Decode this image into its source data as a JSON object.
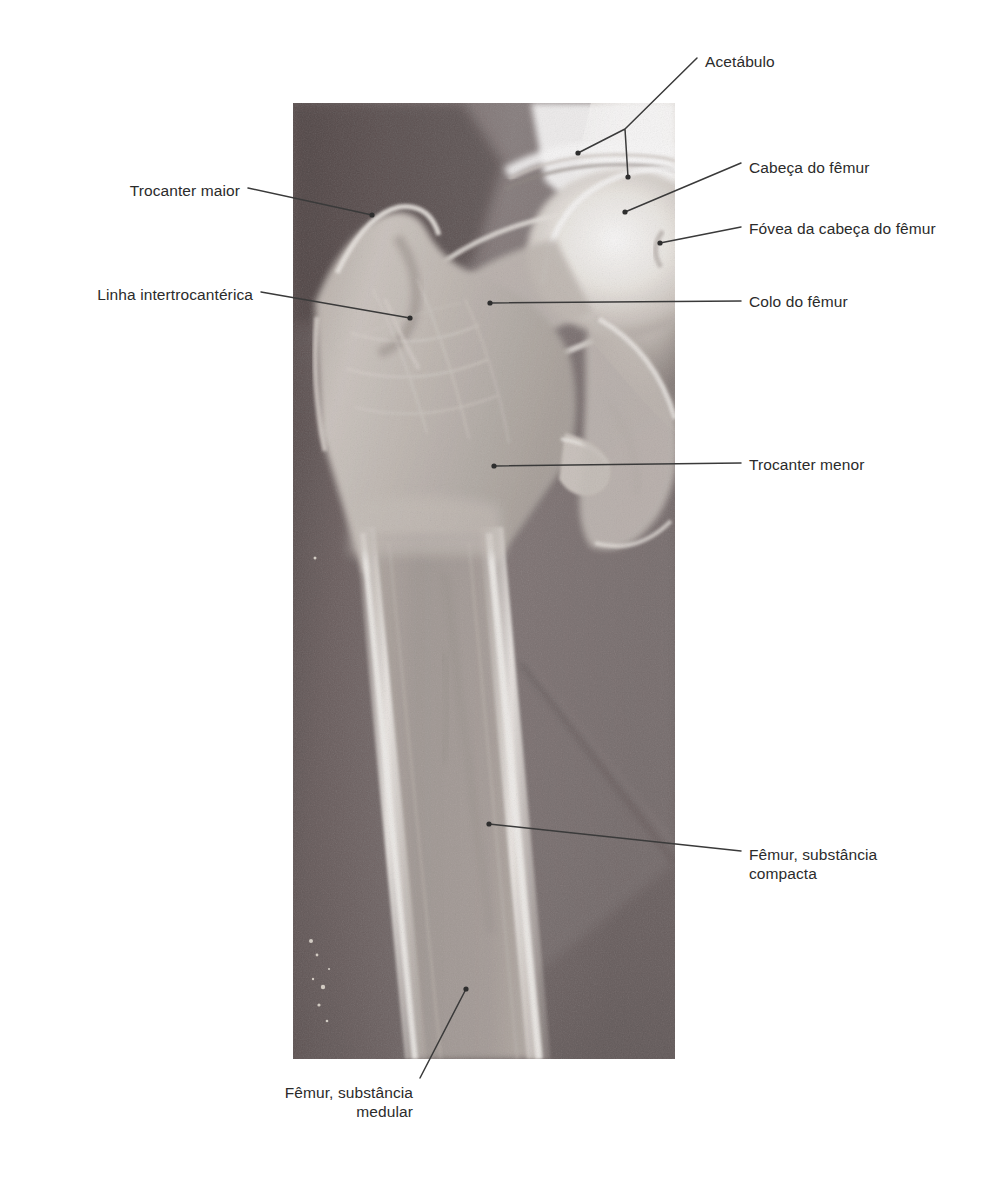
{
  "figure": {
    "image_kind": "x-ray-radiograph",
    "background_color": "#ffffff",
    "text_color": "#2b2b2b",
    "leader_color": "#3a3a3a"
  },
  "xray": {
    "left": 293,
    "top": 103,
    "width": 382,
    "height": 956,
    "soft_tissue_dark": "#605353",
    "soft_tissue_mid": "#7a7070",
    "bone_mid": "#b9b2ac",
    "bone_bright": "#e6e2dc",
    "bone_white": "#f6f4f1"
  },
  "labels": [
    {
      "id": "acetabulo",
      "name": "Acetábulo",
      "lines": [
        "Acetábulo"
      ],
      "align": "left",
      "x": 705,
      "y": 52
    },
    {
      "id": "cabeca-do-femur",
      "name": "Cabeça do fêmur",
      "lines": [
        "Cabeça do fêmur"
      ],
      "align": "left",
      "x": 749,
      "y": 158
    },
    {
      "id": "fovea-da-cabeca-do-femur",
      "name": "Fóvea da cabeça do fêmur",
      "lines": [
        "Fóvea da cabeça do fêmur"
      ],
      "align": "left",
      "x": 749,
      "y": 219
    },
    {
      "id": "colo-do-femur",
      "name": "Colo do fêmur",
      "lines": [
        "Colo do fêmur"
      ],
      "align": "left",
      "x": 749,
      "y": 292
    },
    {
      "id": "trocanter-menor",
      "name": "Trocanter menor",
      "lines": [
        "Trocanter menor"
      ],
      "align": "left",
      "x": 749,
      "y": 455
    },
    {
      "id": "femur-substancia-compacta",
      "name": "Fêmur, substância compacta",
      "lines": [
        "Fêmur, substância",
        "compacta"
      ],
      "align": "left",
      "x": 749,
      "y": 845
    },
    {
      "id": "trocanter-maior",
      "name": "Trocanter maior",
      "lines": [
        "Trocanter maior"
      ],
      "align": "right",
      "x": 117,
      "y": 181,
      "right_edge": 240
    },
    {
      "id": "linha-intertrocanterica",
      "name": "Linha intertrocantérica",
      "lines": [
        "Linha intertrocantérica"
      ],
      "align": "right",
      "x": 68,
      "y": 285,
      "right_edge": 253
    },
    {
      "id": "femur-substancia-medular",
      "name": "Fêmur, substância medular",
      "lines": [
        "Fêmur, substância",
        "medular"
      ],
      "align": "right",
      "x": 255,
      "y": 1083,
      "right_edge": 413
    }
  ],
  "leaders": [
    {
      "id": "leader-acetabulo",
      "for": "Acetábulo",
      "kind": "forked",
      "path": "M 697 58 L 625 129 M 625 129 L 578 153 M 625 129 L 628 177",
      "dots": [
        [
          578,
          153
        ],
        [
          628,
          177
        ]
      ]
    },
    {
      "id": "leader-cabeca-do-femur",
      "for": "Cabeça do fêmur",
      "kind": "straight",
      "path": "M 741 163 L 625 212",
      "dots": [
        [
          625,
          212
        ]
      ]
    },
    {
      "id": "leader-fovea-da-cabeca-do-femur",
      "for": "Fóvea da cabeça do fêmur",
      "kind": "straight",
      "path": "M 741 227 L 660 243",
      "dots": [
        [
          660,
          243
        ]
      ]
    },
    {
      "id": "leader-colo-do-femur",
      "for": "Colo do fêmur",
      "kind": "straight",
      "path": "M 741 301 L 490 303",
      "dots": [
        [
          490,
          303
        ]
      ]
    },
    {
      "id": "leader-trocanter-menor",
      "for": "Trocanter menor",
      "kind": "straight",
      "path": "M 741 463 L 494 466",
      "dots": [
        [
          494,
          466
        ]
      ]
    },
    {
      "id": "leader-femur-substancia-compacta",
      "for": "Fêmur, substância compacta",
      "kind": "straight",
      "path": "M 741 851 L 489 824",
      "dots": [
        [
          489,
          824
        ]
      ]
    },
    {
      "id": "leader-trocanter-maior",
      "for": "Trocanter maior",
      "kind": "straight",
      "path": "M 248 188 L 372 215",
      "dots": [
        [
          372,
          215
        ]
      ]
    },
    {
      "id": "leader-linha-intertrocanterica",
      "for": "Linha intertrocantérica",
      "kind": "straight",
      "path": "M 261 292 L 410 318",
      "dots": [
        [
          410,
          318
        ]
      ]
    },
    {
      "id": "leader-femur-substancia-medular",
      "for": "Fêmur, substância medular",
      "kind": "straight",
      "path": "M 420 1078 L 466 989",
      "dots": [
        [
          466,
          989
        ]
      ]
    }
  ]
}
